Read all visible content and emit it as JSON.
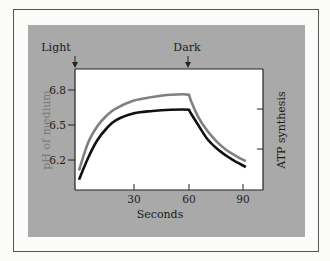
{
  "chart_data": {
    "type": "line",
    "title": "",
    "xlabel": "Seconds",
    "ylabel_left": "pH of medium",
    "ylabel_right": "ATP synthesis",
    "xlim": [
      0,
      94
    ],
    "ylim_left": [
      6.0,
      6.98
    ],
    "x_ticks": [
      30,
      60,
      90
    ],
    "x_tick_labels": [
      "30",
      "60",
      "90"
    ],
    "y_ticks_left": [
      6.2,
      6.5,
      6.8
    ],
    "y_tick_labels_left": [
      "6.2",
      "6.5",
      "6.8"
    ],
    "y_ticks_right_count": 2,
    "annotations": [
      {
        "text": "Light",
        "x": 0,
        "arrow": "down"
      },
      {
        "text": "Dark",
        "x": 60,
        "arrow": "down"
      }
    ],
    "series": [
      {
        "name": "pH of medium",
        "color": "#808080",
        "x": [
          0,
          5,
          10,
          15,
          20,
          30,
          40,
          50,
          60,
          61,
          65,
          70,
          75,
          80,
          85,
          91
        ],
        "values": [
          6.11,
          6.35,
          6.49,
          6.58,
          6.64,
          6.71,
          6.74,
          6.76,
          6.76,
          6.71,
          6.57,
          6.45,
          6.36,
          6.29,
          6.24,
          6.19
        ]
      },
      {
        "name": "ATP synthesis",
        "color": "#111111",
        "x": [
          0,
          5,
          10,
          15,
          20,
          30,
          40,
          50,
          60,
          61,
          65,
          70,
          75,
          80,
          85,
          91
        ],
        "values": [
          6.03,
          6.22,
          6.37,
          6.47,
          6.54,
          6.6,
          6.62,
          6.63,
          6.63,
          6.6,
          6.5,
          6.38,
          6.3,
          6.24,
          6.19,
          6.14
        ]
      }
    ]
  },
  "labels": {
    "light": "Light",
    "dark": "Dark",
    "xlabel": "Seconds",
    "ylabel_left": "pH of medium",
    "ylabel_right": "ATP synthesis",
    "x30": "30",
    "x60": "60",
    "x90": "90",
    "y62": "6.2",
    "y65": "6.5",
    "y68": "6.8"
  },
  "colors": {
    "panel": "#a9a9a9",
    "plot_bg": "#ffffff",
    "grey_curve": "#808080",
    "black_curve": "#111111"
  }
}
